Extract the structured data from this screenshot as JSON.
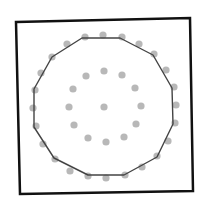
{
  "diagram": {
    "type": "convex-hull-of-point-set",
    "colors": {
      "background": "#ffffff",
      "frame": "#111111",
      "hull": "#444444",
      "points": "#b8b8b8"
    },
    "frame": {
      "corners": [
        [
          16,
          22
        ],
        [
          190,
          18
        ],
        [
          193,
          191
        ],
        [
          20,
          194
        ]
      ],
      "stroke_width": 2.5
    },
    "hull": {
      "stroke_width": 1.4,
      "vertices": [
        [
          82,
          38
        ],
        [
          120,
          38
        ],
        [
          153,
          55
        ],
        [
          172,
          88
        ],
        [
          173,
          124
        ],
        [
          157,
          157
        ],
        [
          124,
          175
        ],
        [
          88,
          175
        ],
        [
          54,
          158
        ],
        [
          34,
          127
        ],
        [
          34,
          89
        ],
        [
          52,
          57
        ]
      ]
    },
    "point_radius": 3.6,
    "points": {
      "outer_ring": [
        [
          85,
          37
        ],
        [
          103,
          35
        ],
        [
          122,
          37
        ],
        [
          139,
          44
        ],
        [
          154,
          54
        ],
        [
          166,
          70
        ],
        [
          174,
          87
        ],
        [
          176,
          105
        ],
        [
          175,
          123
        ],
        [
          168,
          141
        ],
        [
          157,
          156
        ],
        [
          142,
          167
        ],
        [
          125,
          175
        ],
        [
          106,
          178
        ],
        [
          88,
          176
        ],
        [
          70,
          171
        ],
        [
          55,
          159
        ],
        [
          43,
          144
        ],
        [
          36,
          126
        ],
        [
          33,
          108
        ],
        [
          35,
          90
        ],
        [
          41,
          73
        ],
        [
          52,
          57
        ],
        [
          67,
          44
        ]
      ],
      "inner_ring": [
        [
          104,
          71
        ],
        [
          122,
          75
        ],
        [
          135,
          88
        ],
        [
          141,
          106
        ],
        [
          136,
          124
        ],
        [
          124,
          137
        ],
        [
          106,
          142
        ],
        [
          88,
          138
        ],
        [
          74,
          125
        ],
        [
          69,
          107
        ],
        [
          73,
          89
        ],
        [
          86,
          76
        ]
      ],
      "center": [
        [
          104,
          107
        ]
      ]
    }
  }
}
